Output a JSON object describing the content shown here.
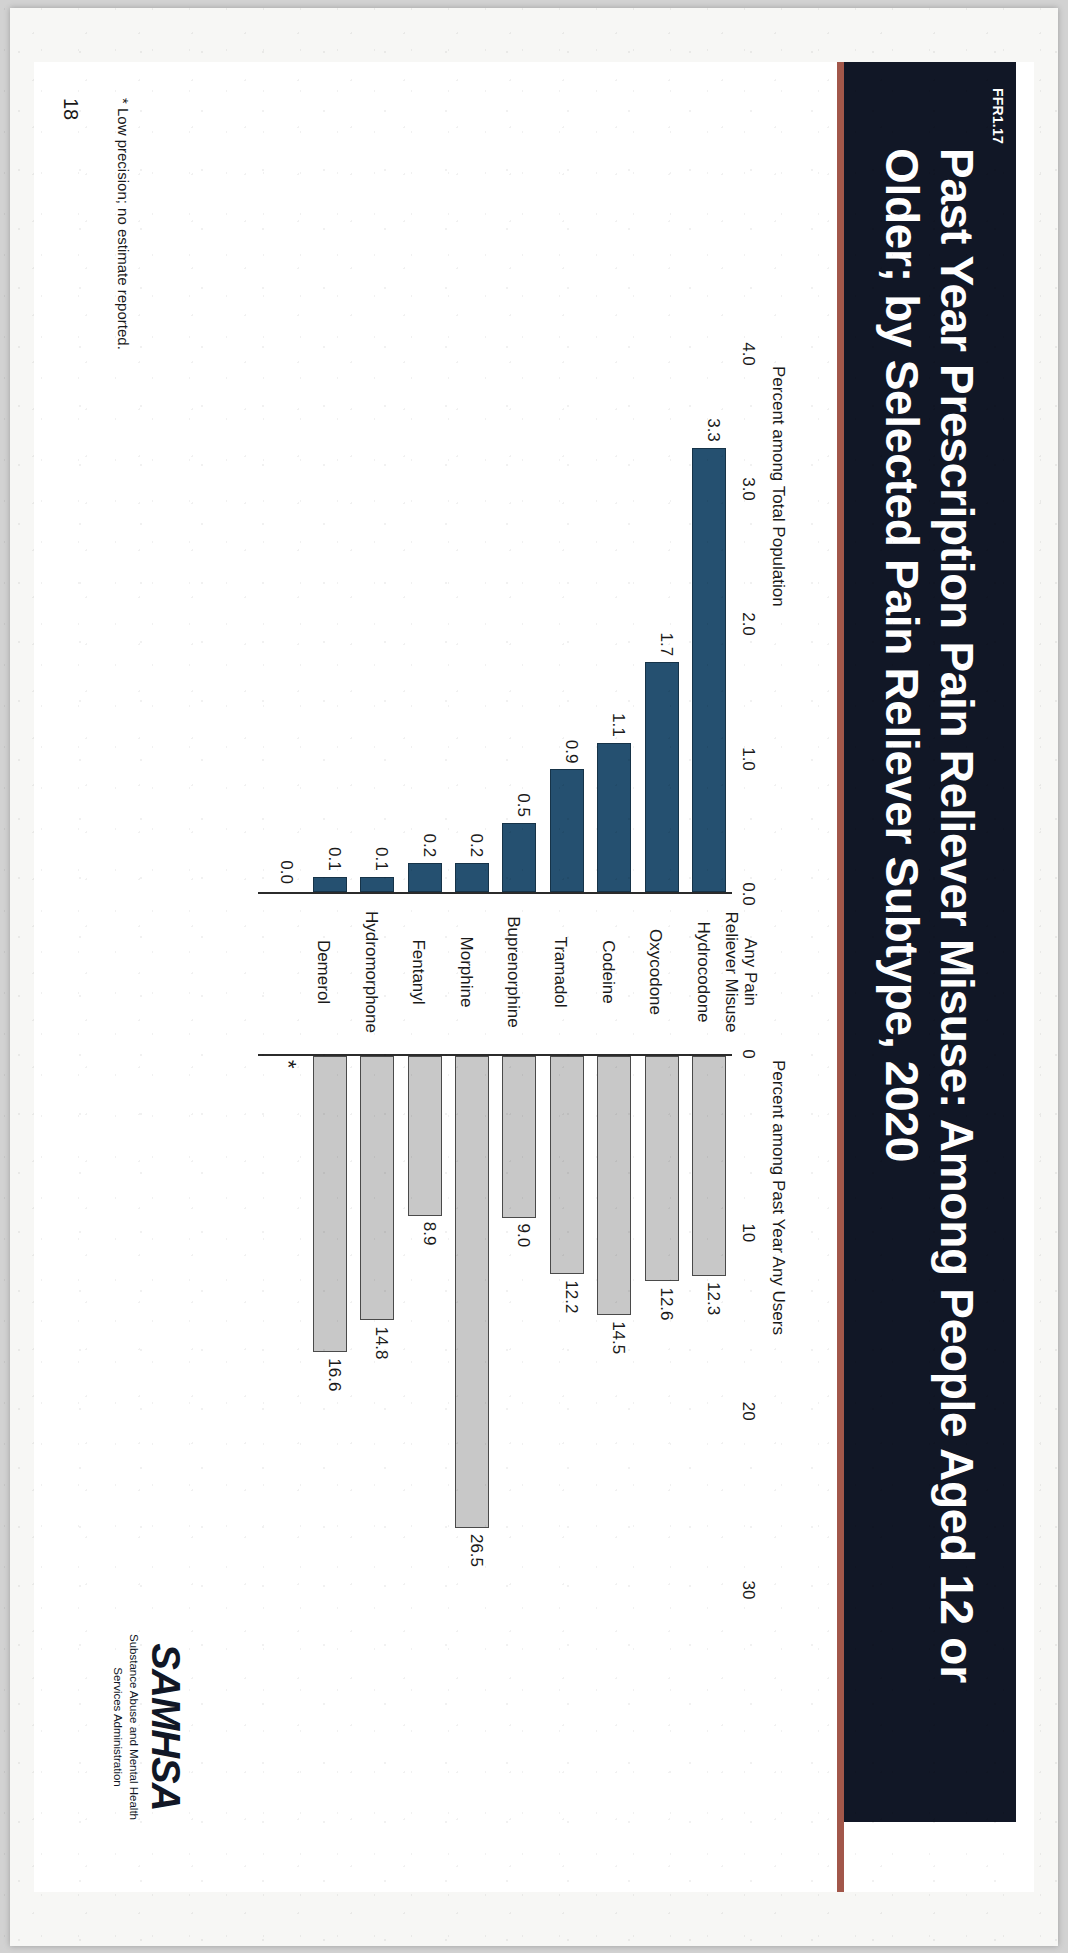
{
  "slide": {
    "ffr_label": "FFR1.17",
    "title": "Past Year Prescription Pain Reliever Misuse: Among People Aged 12 or Older; by Selected Pain Reliever Subtype, 2020",
    "footnote": "* Low precision; no estimate reported.",
    "page_number": "18",
    "accent_color": "#a2574a",
    "title_bg_color": "#111726"
  },
  "logo": {
    "wordmark": "SAMHSA",
    "line1": "Substance Abuse and Mental Health",
    "line2": "Services Administration"
  },
  "chart_data": {
    "type": "bar",
    "title": "Past Year Prescription Pain Reliever Misuse: Among People Aged 12 or Older; by Selected Pain Reliever Subtype, 2020",
    "orientation": "back-to-back horizontal (pyramid)",
    "categories": [
      "Any Pain Reliever Misuse",
      "Hydrocodone",
      "Oxycodone",
      "Codeine",
      "Tramadol",
      "Buprenorphine",
      "Morphine",
      "Fentanyl",
      "Hydromorphone",
      "Demerol"
    ],
    "category_lines": [
      [
        "Any Pain",
        "Reliever Misuse"
      ],
      [
        "Hydrocodone"
      ],
      [
        "Oxycodone"
      ],
      [
        "Codeine"
      ],
      [
        "Tramadol"
      ],
      [
        "Buprenorphine"
      ],
      [
        "Morphine"
      ],
      [
        "Fentanyl"
      ],
      [
        "Hydromorphone"
      ],
      [
        "Demerol"
      ]
    ],
    "series": [
      {
        "name": "Percent among Total Population",
        "side": "left",
        "color": "#255070",
        "axis_label": "Percent among Total Population",
        "ticks": [
          "4.0",
          "3.0",
          "2.0",
          "1.0",
          "0.0"
        ],
        "tick_values": [
          4.0,
          3.0,
          2.0,
          1.0,
          0.0
        ],
        "xlim": [
          0,
          4.0
        ],
        "values": [
          3.3,
          1.7,
          1.1,
          0.9,
          0.5,
          0.2,
          0.2,
          0.1,
          0.1,
          0.0
        ],
        "labels": [
          "3.3",
          "1.7",
          "1.1",
          "0.9",
          "0.5",
          "0.2",
          "0.2",
          "0.1",
          "0.1",
          "0.0"
        ]
      },
      {
        "name": "Percent among Past Year Any Users",
        "side": "right",
        "color": "#c8c8c8",
        "axis_label": "Percent among Past Year Any Users",
        "ticks": [
          "0",
          "10",
          "20",
          "30"
        ],
        "tick_values": [
          0,
          10,
          20,
          30
        ],
        "xlim": [
          0,
          30
        ],
        "values": [
          12.3,
          12.6,
          14.5,
          12.2,
          9.0,
          26.5,
          8.9,
          14.8,
          16.6,
          null
        ],
        "labels": [
          "12.3",
          "12.6",
          "14.5",
          "12.2",
          "9.0",
          "26.5",
          "8.9",
          "14.8",
          "16.6",
          "*"
        ]
      }
    ],
    "grid": false,
    "legend": "none"
  }
}
